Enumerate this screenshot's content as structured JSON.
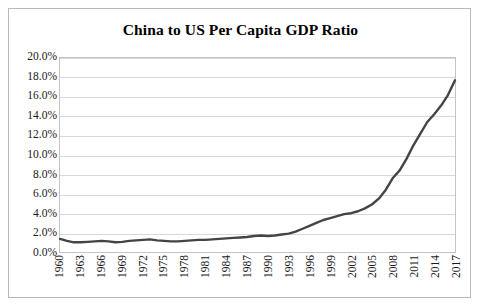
{
  "figure": {
    "border_color": "#b9b9b9",
    "background": "#ffffff"
  },
  "chart_data": {
    "type": "line",
    "title": "China to US Per Capita GDP Ratio",
    "xlabel": "",
    "ylabel": "",
    "grid": true,
    "legend": false,
    "line_color": "#444444",
    "line_width": 2.4,
    "ylim": [
      0,
      20
    ],
    "ytick_labels": [
      "0.0%",
      "2.0%",
      "4.0%",
      "6.0%",
      "8.0%",
      "10.0%",
      "12.0%",
      "14.0%",
      "16.0%",
      "18.0%",
      "20.0%"
    ],
    "ytick_values": [
      0,
      2,
      4,
      6,
      8,
      10,
      12,
      14,
      16,
      18,
      20
    ],
    "xtick_labels": [
      "1960",
      "1963",
      "1966",
      "1969",
      "1972",
      "1975",
      "1978",
      "1981",
      "1984",
      "1987",
      "1990",
      "1993",
      "1996",
      "1999",
      "2002",
      "2005",
      "2008",
      "2011",
      "2014",
      "2017"
    ],
    "x": [
      1960,
      1961,
      1962,
      1963,
      1964,
      1965,
      1966,
      1967,
      1968,
      1969,
      1970,
      1971,
      1972,
      1973,
      1974,
      1975,
      1976,
      1977,
      1978,
      1979,
      1980,
      1981,
      1982,
      1983,
      1984,
      1985,
      1986,
      1987,
      1988,
      1989,
      1990,
      1991,
      1992,
      1993,
      1994,
      1995,
      1996,
      1997,
      1998,
      1999,
      2000,
      2001,
      2002,
      2003,
      2004,
      2005,
      2006,
      2007,
      2008,
      2009,
      2010,
      2011,
      2012,
      2013,
      2014,
      2015,
      2016,
      2017
    ],
    "values": [
      1.35,
      1.15,
      1.0,
      1.0,
      1.05,
      1.1,
      1.15,
      1.1,
      1.0,
      1.05,
      1.15,
      1.2,
      1.25,
      1.3,
      1.2,
      1.15,
      1.1,
      1.1,
      1.15,
      1.2,
      1.25,
      1.25,
      1.3,
      1.35,
      1.4,
      1.45,
      1.5,
      1.55,
      1.65,
      1.7,
      1.65,
      1.7,
      1.8,
      1.9,
      2.1,
      2.4,
      2.7,
      3.0,
      3.3,
      3.5,
      3.7,
      3.9,
      4.0,
      4.2,
      4.5,
      4.9,
      5.5,
      6.4,
      7.6,
      8.4,
      9.6,
      11.0,
      12.2,
      13.4,
      14.2,
      15.1,
      16.2,
      17.7
    ],
    "annotations": []
  }
}
